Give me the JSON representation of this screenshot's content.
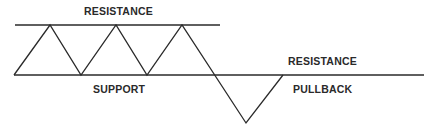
{
  "diagram": {
    "labels": {
      "top_resistance": "RESISTANCE",
      "support": "SUPPORT",
      "right_resistance": "RESISTANCE",
      "pullback": "PULLBACK"
    },
    "colors": {
      "line": "#2a2a2a",
      "background": "#ffffff"
    }
  }
}
